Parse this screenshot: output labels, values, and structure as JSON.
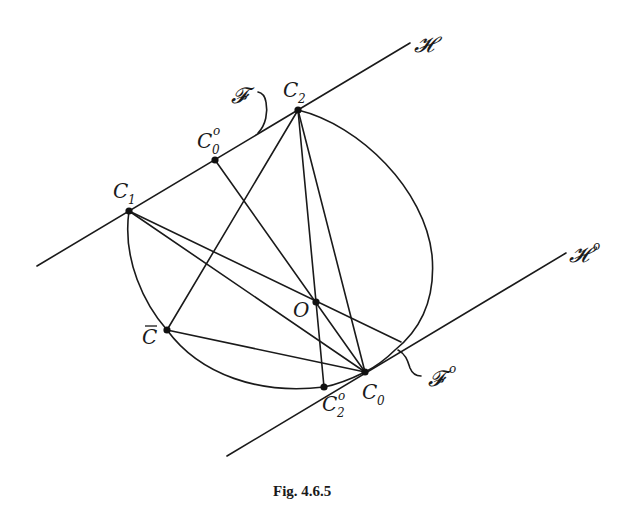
{
  "figure": {
    "caption": "Fig. 4.6.5",
    "lines": {
      "H": {
        "label": "𝓗",
        "sup": ""
      },
      "H0": {
        "label": "𝓗",
        "sup": "o"
      }
    },
    "faces": {
      "F": {
        "label": "𝓕",
        "sup": ""
      },
      "F0": {
        "label": "𝓕",
        "sup": "o"
      }
    },
    "points": {
      "C1": {
        "base": "C",
        "sub": "1",
        "sup": ""
      },
      "C2": {
        "base": "C",
        "sub": "2",
        "sup": ""
      },
      "C0o": {
        "base": "C",
        "sub": "0",
        "sup": "o"
      },
      "C0": {
        "base": "C",
        "sub": "0",
        "sup": ""
      },
      "C2o": {
        "base": "C",
        "sub": "2",
        "sup": "o"
      },
      "O": {
        "base": "O",
        "sub": "",
        "sup": ""
      },
      "Cbar": {
        "base": "C",
        "sub": "",
        "sup": "",
        "overline": true
      }
    }
  }
}
